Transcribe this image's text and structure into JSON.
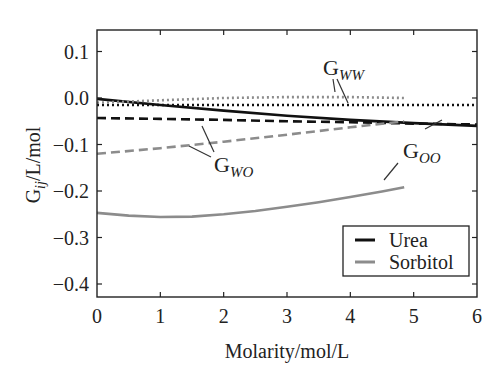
{
  "chart_data": {
    "type": "line",
    "title": "",
    "xlabel": "Molarity/mol/L",
    "ylabel": "G_ij/L/mol",
    "xlim": [
      0,
      6
    ],
    "ylim": [
      -0.45,
      0.15
    ],
    "x_ticks": [
      "0",
      "1",
      "2",
      "3",
      "4",
      "5",
      "6"
    ],
    "y_ticks": [
      "0.1",
      "0.0",
      "-0.1",
      "-0.2",
      "-0.3",
      "-0.4"
    ],
    "grid": false,
    "legend": {
      "position": "lower right",
      "entries": [
        {
          "label": "Urea",
          "color": "#111111"
        },
        {
          "label": "Sorbitol",
          "color": "#8c8c8c"
        }
      ]
    },
    "series": [
      {
        "name": "Urea G_WW",
        "solute": "Urea",
        "quantity": "G_WW",
        "style": "dotted",
        "color": "#111111",
        "x": [
          0,
          1,
          2,
          3,
          4,
          5,
          6
        ],
        "y": [
          -0.015,
          -0.015,
          -0.015,
          -0.015,
          -0.015,
          -0.015,
          -0.015
        ]
      },
      {
        "name": "Urea G_OO",
        "solute": "Urea",
        "quantity": "G_OO",
        "style": "solid",
        "color": "#111111",
        "x": [
          0,
          1,
          2,
          3,
          4,
          5,
          6
        ],
        "y": [
          -0.002,
          -0.015,
          -0.027,
          -0.038,
          -0.047,
          -0.054,
          -0.06
        ]
      },
      {
        "name": "Urea G_WO",
        "solute": "Urea",
        "quantity": "G_WO",
        "style": "dashed",
        "color": "#111111",
        "x": [
          0,
          1,
          2,
          3,
          4,
          5,
          6
        ],
        "y": [
          -0.043,
          -0.045,
          -0.047,
          -0.05,
          -0.052,
          -0.055,
          -0.057
        ]
      },
      {
        "name": "Sorbitol G_WW",
        "solute": "Sorbitol",
        "quantity": "G_WW",
        "style": "dotted",
        "color": "#8c8c8c",
        "x": [
          0,
          1,
          2,
          3,
          4,
          4.85
        ],
        "y": [
          -0.01,
          -0.005,
          0.0,
          0.002,
          0.002,
          0.0
        ]
      },
      {
        "name": "Sorbitol G_WO",
        "solute": "Sorbitol",
        "quantity": "G_WO",
        "style": "dashed",
        "color": "#8c8c8c",
        "x": [
          0,
          1,
          2,
          3,
          4,
          4.85
        ],
        "y": [
          -0.12,
          -0.108,
          -0.094,
          -0.079,
          -0.063,
          -0.05
        ]
      },
      {
        "name": "Sorbitol G_OO",
        "solute": "Sorbitol",
        "quantity": "G_OO",
        "style": "solid",
        "color": "#8c8c8c",
        "x": [
          0,
          0.5,
          1,
          1.5,
          2,
          2.5,
          3,
          3.5,
          4,
          4.5,
          4.85
        ],
        "y": [
          -0.247,
          -0.253,
          -0.256,
          -0.255,
          -0.25,
          -0.243,
          -0.234,
          -0.224,
          -0.213,
          -0.201,
          -0.192
        ]
      }
    ],
    "annotations": [
      {
        "text": "G",
        "subscript": "WW",
        "x": 3.2,
        "y": 0.04
      },
      {
        "text": "G",
        "subscript": "WO",
        "x": 1.2,
        "y": -0.17
      },
      {
        "text": "G",
        "subscript": "OO",
        "x": 4.7,
        "y": -0.15
      }
    ]
  },
  "labels": {
    "xlabel": "Molarity/mol/L",
    "ylabel_main": "G",
    "ylabel_sub": "ij",
    "ylabel_rest": "/L/mol",
    "legend_urea": "Urea",
    "legend_sorbitol": "Sorbitol",
    "ann_ww_g": "G",
    "ann_ww_sub": "WW",
    "ann_wo_g": "G",
    "ann_wo_sub": "WO",
    "ann_oo_g": "G",
    "ann_oo_sub": "OO"
  }
}
